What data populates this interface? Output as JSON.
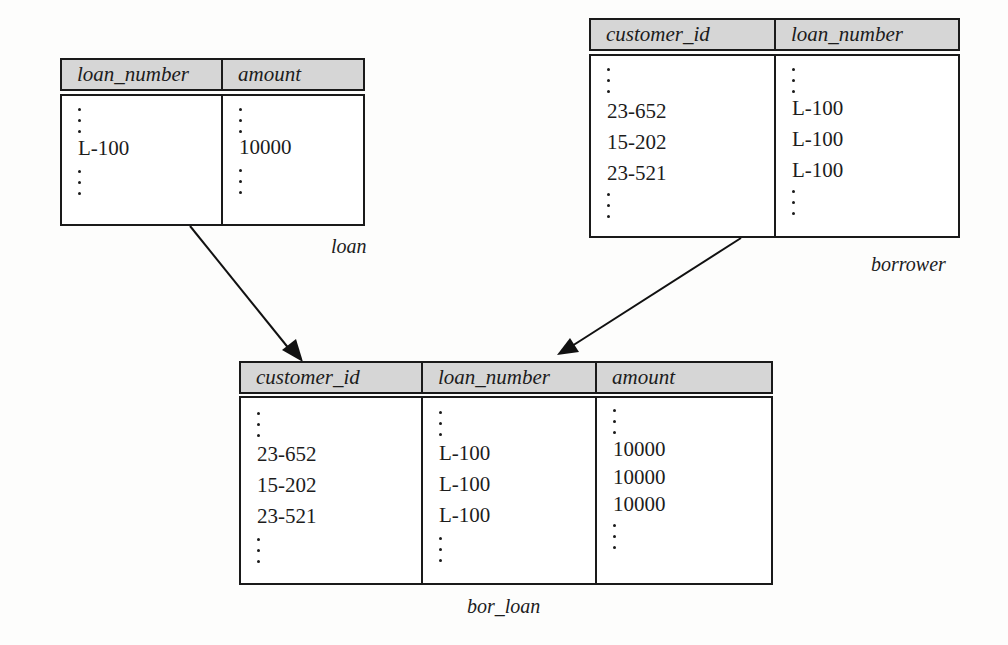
{
  "tables": {
    "loan": {
      "name": "loan",
      "columns": [
        "loan_number",
        "amount"
      ],
      "rows": [
        [
          "L-100",
          "10000"
        ]
      ]
    },
    "borrower": {
      "name": "borrower",
      "columns": [
        "customer_id",
        "loan_number"
      ],
      "rows": [
        [
          "23-652",
          "L-100"
        ],
        [
          "15-202",
          "L-100"
        ],
        [
          "23-521",
          "L-100"
        ]
      ]
    },
    "bor_loan": {
      "name": "bor_loan",
      "columns": [
        "customer_id",
        "loan_number",
        "amount"
      ],
      "rows": [
        [
          "23-652",
          "L-100",
          "10000"
        ],
        [
          "15-202",
          "L-100",
          "10000"
        ],
        [
          "23-521",
          "L-100",
          "10000"
        ]
      ]
    }
  },
  "arrows": [
    {
      "from": "loan",
      "to": "bor_loan"
    },
    {
      "from": "borrower",
      "to": "bor_loan"
    }
  ],
  "colors": {
    "header_fill": "#d6d6d6",
    "line": "#1a1a1a"
  }
}
